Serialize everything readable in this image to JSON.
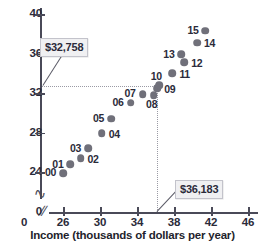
{
  "chart_data": {
    "type": "scatter",
    "title": "",
    "xlabel": "Income (thousands of dollars per year)",
    "ylabel": "",
    "xlim": [
      24.8,
      47.4
    ],
    "ylim": [
      22.6,
      40.4
    ],
    "grid": false,
    "legend": "none",
    "x_ticks": [
      "0",
      "26",
      "30",
      "34",
      "38",
      "42",
      "46"
    ],
    "y_ticks": [
      "0",
      "24",
      "28",
      "32",
      "36",
      "40"
    ],
    "axis_break_x": true,
    "axis_break_y": true,
    "points": [
      {
        "label": "00",
        "x": 26.0,
        "y": 23.9,
        "label_pos": "left"
      },
      {
        "label": "01",
        "x": 26.8,
        "y": 24.8,
        "label_pos": "left"
      },
      {
        "label": "02",
        "x": 27.9,
        "y": 25.4,
        "label_pos": "right"
      },
      {
        "label": "03",
        "x": 28.7,
        "y": 26.4,
        "label_pos": "left"
      },
      {
        "label": "04",
        "x": 30.2,
        "y": 27.9,
        "label_pos": "right"
      },
      {
        "label": "05",
        "x": 31.2,
        "y": 29.4,
        "label_pos": "left"
      },
      {
        "label": "06",
        "x": 33.3,
        "y": 31.0,
        "label_pos": "left"
      },
      {
        "label": "07",
        "x": 34.6,
        "y": 31.9,
        "label_pos": "left"
      },
      {
        "label": "08",
        "x": 35.8,
        "y": 31.8,
        "label_pos": "below"
      },
      {
        "label": "09",
        "x": 36.2,
        "y": 32.5,
        "label_pos": "right"
      },
      {
        "label": "10",
        "x": 36.4,
        "y": 32.8,
        "label_pos": "above"
      },
      {
        "label": "11",
        "x": 37.8,
        "y": 34.0,
        "label_pos": "right"
      },
      {
        "label": "12",
        "x": 39.1,
        "y": 35.1,
        "label_pos": "right"
      },
      {
        "label": "13",
        "x": 38.8,
        "y": 35.9,
        "label_pos": "left"
      },
      {
        "label": "14",
        "x": 40.5,
        "y": 37.1,
        "label_pos": "right"
      },
      {
        "label": "15",
        "x": 41.4,
        "y": 38.3,
        "label_pos": "left"
      }
    ],
    "reference_lines": [
      {
        "name": "median-income-line",
        "orientation": "horizontal",
        "value": 32.758,
        "extends_to_x": 36.183,
        "style": "dotted"
      },
      {
        "name": "mean-income-line",
        "orientation": "vertical",
        "value": 36.183,
        "extends_to_y": 32.758,
        "style": "dotted"
      }
    ],
    "annotations": [
      {
        "name": "callout-median",
        "text": "$32,758",
        "points_to": "horizontal-reference-line"
      },
      {
        "name": "callout-mean",
        "text": "$36,183",
        "points_to": "vertical-reference-line"
      }
    ],
    "colors": {
      "marker": "#70707a",
      "axis": "#4a4a58",
      "text": "#2b2b3a",
      "reference_line": "#9a9aa4",
      "callout_background": "#f0f0f2",
      "callout_border": "#c3c3cb",
      "background": "#ffffff"
    }
  }
}
